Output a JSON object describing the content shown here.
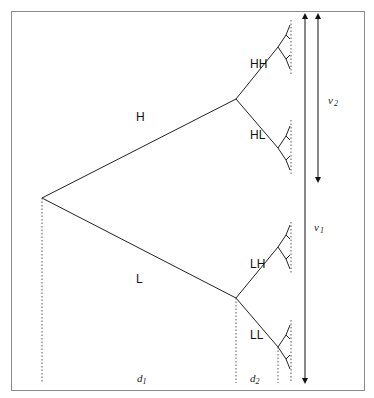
{
  "diagram": {
    "type": "decision-tree",
    "labels": {
      "H": "H",
      "L": "L",
      "HH": "HH",
      "HL": "HL",
      "LH": "LH",
      "LL": "LL"
    },
    "dimensions": {
      "d1": {
        "base": "d",
        "sub": "1"
      },
      "d2": {
        "base": "d",
        "sub": "2"
      },
      "v1": {
        "base": "v",
        "sub": "1"
      },
      "v2": {
        "base": "v",
        "sub": "2"
      }
    },
    "colors": {
      "line": "#222222",
      "frame": "#888888",
      "dotted": "#555555"
    }
  }
}
